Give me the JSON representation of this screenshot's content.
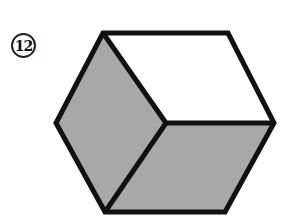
{
  "problem": {
    "number": "12"
  },
  "figure": {
    "type": "isometric-cube",
    "colors": {
      "outline": "#111111",
      "shaded_face": "#a8a8a8",
      "unshaded_face": "#ffffff"
    },
    "faces": [
      {
        "name": "top-face",
        "shaded": false
      },
      {
        "name": "left-face",
        "shaded": true
      },
      {
        "name": "bottom-right-face",
        "shaded": true
      }
    ]
  }
}
